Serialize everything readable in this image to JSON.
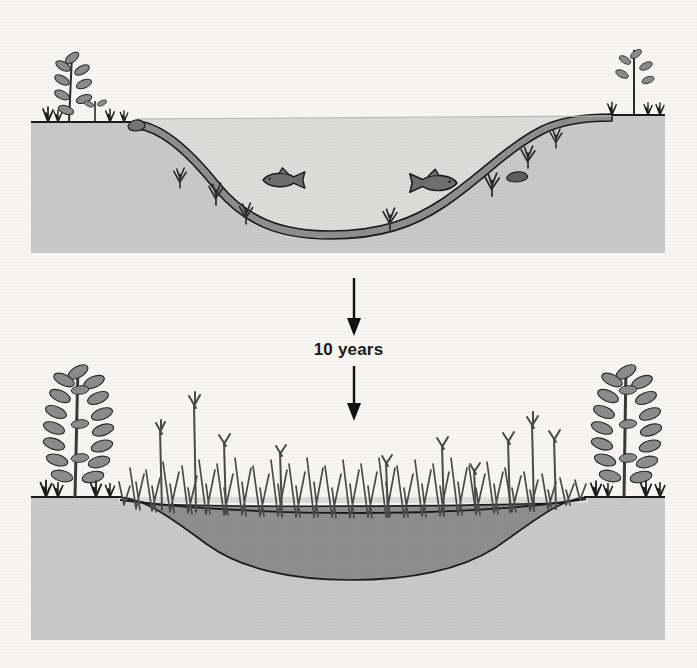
{
  "figure": {
    "background_color": "#f7f6f2",
    "panels": [
      {
        "id": "panel-before",
        "stage_label": "open pond",
        "description": "Open water pond with fish, submerged aquatic plants, thin sediment layer on the basin floor, and young saplings on both banks",
        "ground_color": "#c9c9c9",
        "water_color": "#dcdcda",
        "sediment_color": "#8e8e8e",
        "outline_color": "#1b1b1b",
        "fauna": [
          {
            "name": "fish-left",
            "type": "fish",
            "facing": "left"
          },
          {
            "name": "fish-right",
            "type": "fish",
            "facing": "right"
          }
        ],
        "flora": [
          {
            "name": "sapling-left-bank",
            "type": "young shrub",
            "size": "small"
          },
          {
            "name": "sapling-right-bank",
            "type": "young shrub",
            "size": "small"
          },
          {
            "name": "submerged-plants",
            "type": "submerged aquatic plants",
            "count": 6
          }
        ]
      },
      {
        "id": "panel-after",
        "stage_label": "filled marsh",
        "description": "Basin largely filled with sediment, dense emergent marsh grasses and sedges across the shallow water, and mature leafy shrubs on both banks",
        "ground_color": "#c9c9c9",
        "water_color": "#dcdcda",
        "sediment_color": "#8e8e8e",
        "outline_color": "#1b1b1b",
        "fauna": [],
        "flora": [
          {
            "name": "shrub-left-bank",
            "type": "mature leafy shrub",
            "size": "large"
          },
          {
            "name": "shrub-right-bank",
            "type": "mature leafy shrub",
            "size": "large"
          },
          {
            "name": "emergent-marsh-vegetation",
            "type": "sedges and reeds",
            "count": 60
          }
        ]
      }
    ]
  },
  "transition": {
    "label": "10 years",
    "arrow_top": "down-arrow",
    "arrow_bottom": "down-arrow",
    "arrow_color": "#111111"
  }
}
